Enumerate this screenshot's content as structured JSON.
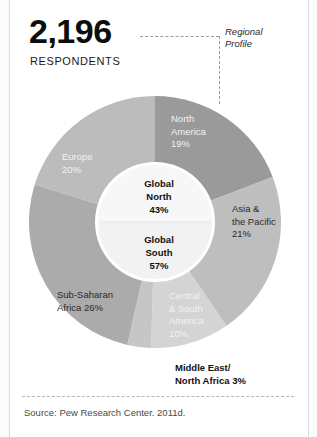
{
  "header": {
    "respondents_value": "2,196",
    "respondents_label": "RESPONDENTS",
    "callout": "Regional\nProfile"
  },
  "footer": {
    "source": "Source: Pew Research Center. 2011d."
  },
  "chart_data": {
    "type": "pie",
    "subtitle": "2,196 RESPONDENTS",
    "total_respondents": 2196,
    "unit": "%",
    "grid": false,
    "legend": "none",
    "legend_position": "in-situ-labels",
    "outer_ring": {
      "name": "Region",
      "categories": [
        "North America",
        "Asia & the Pacific",
        "Central & South America",
        "Middle East/North Africa",
        "Sub-Saharan Africa",
        "Europe"
      ],
      "values": [
        19,
        21,
        10,
        3,
        26,
        20
      ],
      "colors": [
        "#9a9a9a",
        "#bebebe",
        "#d4d4d4",
        "#c6c6c6",
        "#ababab",
        "#bcbcbc"
      ],
      "label_colors": [
        "#f2f2f2",
        "#2a2a2a",
        "#f2f2f2",
        "#111111",
        "#2a2a2a",
        "#f2f2f2"
      ],
      "labels": [
        "North\nAmerica\n19%",
        "Asia &\nthe Pacific\n21%",
        "Central\n& South\nAmerica\n10%",
        "Middle East/\nNorth Africa 3%",
        "Sub-Saharan\nAfrica 26%",
        "Europe\n20%"
      ]
    },
    "inner_ring": {
      "name": "Global North / Global South",
      "categories": [
        "Global North",
        "Global South"
      ],
      "values": [
        43,
        57
      ],
      "colors": [
        "#f7f7f7",
        "#f2f2f2"
      ],
      "labels": [
        "Global\nNorth\n43%",
        "Global\nSouth\n57%"
      ]
    }
  },
  "labels": {
    "north_america": "North\nAmerica\n19%",
    "europe": "Europe\n20%",
    "asia_pacific": "Asia &\nthe Pacific\n21%",
    "sub_saharan_africa": "Sub-Saharan\nAfrica 26%",
    "central_south_america": "Central\n& South\nAmerica\n10%",
    "middle_east_north_africa": "Middle East/\nNorth Africa 3%",
    "global_north": "Global\nNorth\n43%",
    "global_south": "Global\nSouth\n57%"
  }
}
